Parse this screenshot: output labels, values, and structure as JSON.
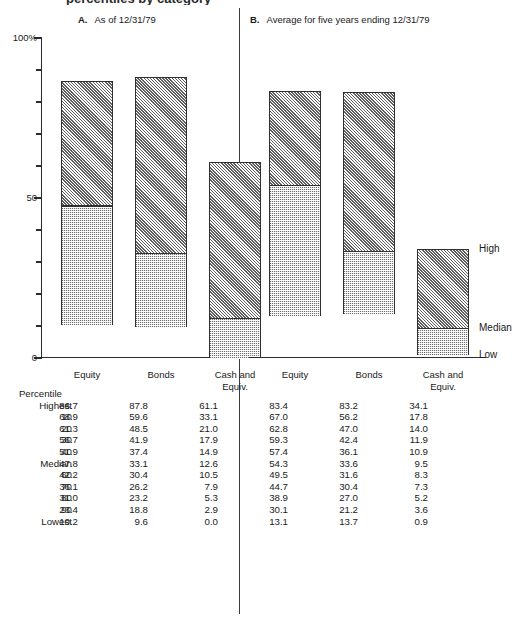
{
  "document": {
    "clipped_title": "percentiles by category"
  },
  "panels": [
    {
      "letter": "A.",
      "title": "As of 12/31/79"
    },
    {
      "letter": "B.",
      "title": "Average for five years ending 12/31/79"
    }
  ],
  "axis": {
    "label_top": "100%",
    "label_mid": "50",
    "label_bottom": "0",
    "ticks": [
      0,
      10,
      20,
      30,
      40,
      50,
      60,
      70,
      80,
      90,
      100
    ],
    "min": 0,
    "max": 100
  },
  "categories": [
    "Equity",
    "Bonds",
    "Cash and\nEquiv."
  ],
  "legend": {
    "high": "High",
    "median": "Median",
    "low": "Low"
  },
  "table": {
    "row_header": "Percentile",
    "rows": [
      {
        "label": "Highest",
        "values": [
          "86.7",
          "87.8",
          "61.1",
          "83.4",
          "83.2",
          "34.1"
        ]
      },
      {
        "label": "10",
        "values": [
          "68.9",
          "59.6",
          "33.1",
          "67.0",
          "56.2",
          "17.8"
        ]
      },
      {
        "label": "20",
        "values": [
          "61.3",
          "48.5",
          "21.0",
          "62.8",
          "47.0",
          "14.0"
        ]
      },
      {
        "label": "30",
        "values": [
          "56.7",
          "41.9",
          "17.9",
          "59.3",
          "42.4",
          "11.9"
        ]
      },
      {
        "label": "40",
        "values": [
          "51.9",
          "37.4",
          "14.9",
          "57.4",
          "36.1",
          "10.9"
        ]
      },
      {
        "label": "Median",
        "values": [
          "47.8",
          "33.1",
          "12.6",
          "54.3",
          "33.6",
          "9.5"
        ]
      },
      {
        "label": "60",
        "values": [
          "42.2",
          "30.4",
          "10.5",
          "49.5",
          "31.6",
          "8.3"
        ]
      },
      {
        "label": "70",
        "values": [
          "36.1",
          "26.2",
          "7.9",
          "44.7",
          "30.4",
          "7.3"
        ]
      },
      {
        "label": "80",
        "values": [
          "31.0",
          "23.2",
          "5.3",
          "38.9",
          "27.0",
          "5.2"
        ]
      },
      {
        "label": "90",
        "values": [
          "23.4",
          "18.8",
          "2.9",
          "30.1",
          "21.2",
          "3.6"
        ]
      },
      {
        "label": "Lowest",
        "values": [
          "10.2",
          "9.6",
          "0.0",
          "13.1",
          "13.7",
          "0.9"
        ]
      }
    ]
  },
  "chart_data": {
    "type": "bar",
    "subtype": "floating-range-bar",
    "xlabel": "",
    "ylabel": "Percent",
    "ylim": [
      0,
      100
    ],
    "yticks": [
      0,
      10,
      20,
      30,
      40,
      50,
      60,
      70,
      80,
      90,
      100
    ],
    "grid": false,
    "legend_position": "right",
    "legend_entries": [
      "High",
      "Median",
      "Low"
    ],
    "panels": [
      {
        "name": "A. As of 12/31/79",
        "categories": [
          "Equity",
          "Bonds",
          "Cash and Equiv."
        ],
        "series": [
          {
            "name": "Highest",
            "values": [
              86.7,
              87.8,
              61.1
            ]
          },
          {
            "name": "Median",
            "values": [
              47.8,
              33.1,
              12.6
            ]
          },
          {
            "name": "Lowest",
            "values": [
              10.2,
              9.6,
              0.0
            ]
          }
        ]
      },
      {
        "name": "B. Average for five years ending 12/31/79",
        "categories": [
          "Equity",
          "Bonds",
          "Cash and Equiv."
        ],
        "series": [
          {
            "name": "Highest",
            "values": [
              83.4,
              83.2,
              34.1
            ]
          },
          {
            "name": "Median",
            "values": [
              54.3,
              33.6,
              9.5
            ]
          },
          {
            "name": "Lowest",
            "values": [
              13.1,
              13.7,
              0.9
            ]
          }
        ]
      }
    ]
  }
}
